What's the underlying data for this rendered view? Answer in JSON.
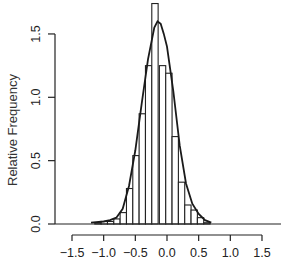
{
  "chart_data": {
    "type": "bar",
    "subtype": "histogram_with_density_curve",
    "title": "",
    "xlabel": "",
    "ylabel": "Relative Frequency",
    "xlim": [
      -1.5,
      1.5
    ],
    "ylim": [
      0,
      1.5
    ],
    "x_ticks": [
      -1.5,
      -1.0,
      -0.5,
      0.0,
      0.5,
      1.0,
      1.5
    ],
    "x_tick_labels": [
      "−1.5",
      "−1.0",
      "−0.5",
      "0.0",
      "0.5",
      "1.0",
      "1.5"
    ],
    "y_ticks": [
      0.0,
      0.5,
      1.0,
      1.5
    ],
    "y_tick_labels": [
      "0.0",
      "0.5",
      "1.0",
      "1.5"
    ],
    "grid": false,
    "legend": null,
    "bin_width": 0.1,
    "bins": [
      {
        "left": -1.14,
        "value": 0.01
      },
      {
        "left": -1.04,
        "value": 0.02
      },
      {
        "left": -0.94,
        "value": 0.02
      },
      {
        "left": -0.84,
        "value": 0.04
      },
      {
        "left": -0.74,
        "value": 0.09
      },
      {
        "left": -0.64,
        "value": 0.28
      },
      {
        "left": -0.54,
        "value": 0.54
      },
      {
        "left": -0.44,
        "value": 0.87
      },
      {
        "left": -0.34,
        "value": 1.25
      },
      {
        "left": -0.24,
        "value": 1.74
      },
      {
        "left": -0.12,
        "value": 1.25
      },
      {
        "left": -0.02,
        "value": 1.19
      },
      {
        "left": 0.08,
        "value": 0.69
      },
      {
        "left": 0.18,
        "value": 0.33
      },
      {
        "left": 0.28,
        "value": 0.15
      },
      {
        "left": 0.38,
        "value": 0.11
      },
      {
        "left": 0.48,
        "value": 0.05
      },
      {
        "left": 0.58,
        "value": 0.01
      }
    ],
    "series": [
      {
        "name": "density curve",
        "type": "line",
        "x": [
          -1.2,
          -1.0,
          -0.9,
          -0.8,
          -0.7,
          -0.6,
          -0.5,
          -0.4,
          -0.3,
          -0.2,
          -0.15,
          -0.1,
          -0.05,
          0.0,
          0.1,
          0.2,
          0.3,
          0.4,
          0.5,
          0.6,
          0.7
        ],
        "values": [
          0.01,
          0.02,
          0.03,
          0.05,
          0.12,
          0.3,
          0.58,
          0.95,
          1.3,
          1.55,
          1.6,
          1.58,
          1.5,
          1.4,
          1.05,
          0.62,
          0.32,
          0.16,
          0.08,
          0.03,
          0.01
        ]
      }
    ]
  }
}
